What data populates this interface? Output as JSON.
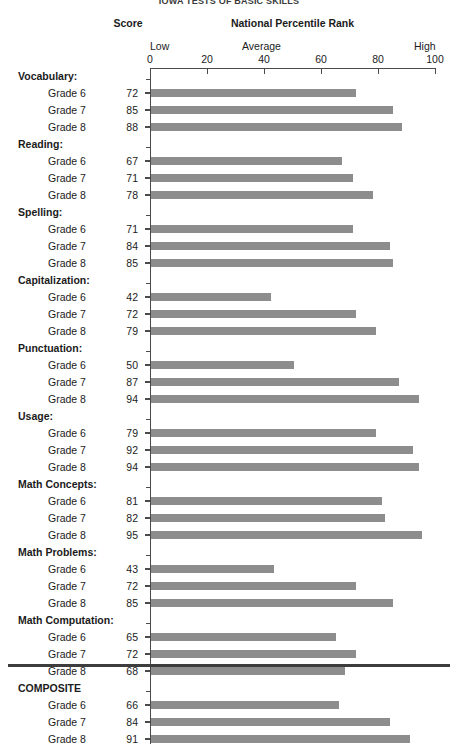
{
  "header": {
    "title": "IOWA TESTS OF BASIC SKILLS",
    "score_label": "Score",
    "npr_label": "National Percentile Rank"
  },
  "scale": {
    "low_label": "Low",
    "average_label": "Average",
    "high_label": "High",
    "ticks": [
      "0",
      "20",
      "40",
      "60",
      "80",
      "100"
    ],
    "tick_values": [
      0,
      20,
      40,
      60,
      80,
      100
    ]
  },
  "colors": {
    "bar": "#8d8d8d",
    "axis": "#4a4a4a",
    "rule": "#3d3d3d",
    "text": "#1b1b1b"
  },
  "chart_data": {
    "type": "bar",
    "orientation": "horizontal",
    "title": "IOWA TESTS OF BASIC SKILLS",
    "xlabel": "National Percentile Rank",
    "ylabel": "",
    "xlim": [
      0,
      100
    ],
    "grid": false,
    "legend": false,
    "tick_labels": [
      "0",
      "20",
      "40",
      "60",
      "80",
      "100"
    ],
    "zone_labels": [
      "Low",
      "Average",
      "High"
    ],
    "groups": [
      {
        "name": "Vocabulary:",
        "rows": [
          {
            "label": "Grade 6",
            "value": 72
          },
          {
            "label": "Grade 7",
            "value": 85
          },
          {
            "label": "Grade 8",
            "value": 88
          }
        ]
      },
      {
        "name": "Reading:",
        "rows": [
          {
            "label": "Grade 6",
            "value": 67
          },
          {
            "label": "Grade 7",
            "value": 71
          },
          {
            "label": "Grade 8",
            "value": 78
          }
        ]
      },
      {
        "name": "Spelling:",
        "rows": [
          {
            "label": "Grade 6",
            "value": 71
          },
          {
            "label": "Grade 7",
            "value": 84
          },
          {
            "label": "Grade 8",
            "value": 85
          }
        ]
      },
      {
        "name": "Capitalization:",
        "rows": [
          {
            "label": "Grade 6",
            "value": 42
          },
          {
            "label": "Grade 7",
            "value": 72
          },
          {
            "label": "Grade 8",
            "value": 79
          }
        ]
      },
      {
        "name": "Punctuation:",
        "rows": [
          {
            "label": "Grade 6",
            "value": 50
          },
          {
            "label": "Grade 7",
            "value": 87
          },
          {
            "label": "Grade 8",
            "value": 94
          }
        ]
      },
      {
        "name": "Usage:",
        "rows": [
          {
            "label": "Grade 6",
            "value": 79
          },
          {
            "label": "Grade 7",
            "value": 92
          },
          {
            "label": "Grade 8",
            "value": 94
          }
        ]
      },
      {
        "name": "Math Concepts:",
        "rows": [
          {
            "label": "Grade 6",
            "value": 81
          },
          {
            "label": "Grade 7",
            "value": 82
          },
          {
            "label": "Grade 8",
            "value": 95
          }
        ]
      },
      {
        "name": "Math Problems:",
        "rows": [
          {
            "label": "Grade 6",
            "value": 43
          },
          {
            "label": "Grade 7",
            "value": 72
          },
          {
            "label": "Grade 8",
            "value": 85
          }
        ]
      },
      {
        "name": "Math Computation:",
        "rows": [
          {
            "label": "Grade 6",
            "value": 65
          },
          {
            "label": "Grade 7",
            "value": 72
          },
          {
            "label": "Grade 8",
            "value": 68
          }
        ]
      },
      {
        "name": "COMPOSITE",
        "rows": [
          {
            "label": "Grade 6",
            "value": 66
          },
          {
            "label": "Grade 7",
            "value": 84
          },
          {
            "label": "Grade 8",
            "value": 91
          }
        ]
      }
    ]
  }
}
